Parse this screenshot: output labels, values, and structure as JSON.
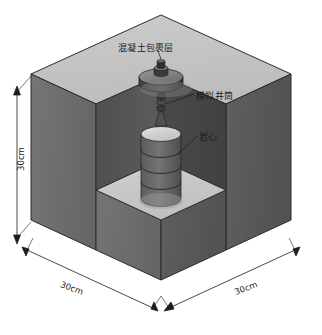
{
  "diagram": {
    "type": "isometric-cutaway-3d",
    "labels": {
      "concrete_cap": "混凝土包裹层",
      "simulated_wellbore": "模拟井筒",
      "rock_core": "岩心"
    },
    "dimensions": {
      "height": "30cm",
      "width_front_left": "30cm",
      "width_front_right": "30cm"
    },
    "colors": {
      "top_face": "#c6c6c6",
      "left_face": "#6e6e6e",
      "right_face": "#5a5a5a",
      "cut_floor": "#c9c9c9",
      "cut_wall_left": "#555555",
      "cut_wall_right": "#4a4a4a",
      "core_body": "#6a6a6a",
      "core_top": "#d8d8d8",
      "cap_disc": "#4e4e4e",
      "cap_top": "#888888",
      "outline": "#2a2a2a",
      "label_text": "#1b1b1b"
    },
    "components": {
      "core_segments": 4,
      "shaft_segments": 4
    }
  }
}
